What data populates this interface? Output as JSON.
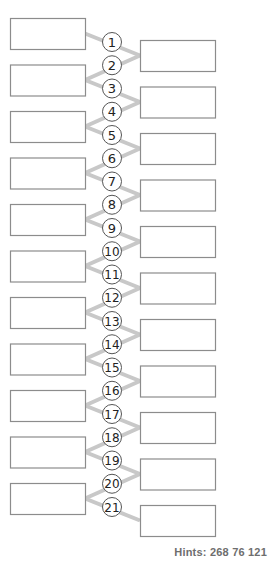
{
  "diagram": {
    "left_boxes": [
      {
        "id": 1,
        "text": ""
      },
      {
        "id": 2,
        "text": ""
      },
      {
        "id": 3,
        "text": ""
      },
      {
        "id": 4,
        "text": ""
      },
      {
        "id": 5,
        "text": ""
      },
      {
        "id": 6,
        "text": ""
      },
      {
        "id": 7,
        "text": ""
      },
      {
        "id": 8,
        "text": ""
      },
      {
        "id": 9,
        "text": ""
      },
      {
        "id": 10,
        "text": ""
      },
      {
        "id": 11,
        "text": ""
      }
    ],
    "right_boxes": [
      {
        "id": 1,
        "text": ""
      },
      {
        "id": 2,
        "text": ""
      },
      {
        "id": 3,
        "text": ""
      },
      {
        "id": 4,
        "text": ""
      },
      {
        "id": 5,
        "text": ""
      },
      {
        "id": 6,
        "text": ""
      },
      {
        "id": 7,
        "text": ""
      },
      {
        "id": 8,
        "text": ""
      },
      {
        "id": 9,
        "text": ""
      },
      {
        "id": 10,
        "text": ""
      },
      {
        "id": 11,
        "text": ""
      }
    ],
    "connectors": [
      "1",
      "2",
      "3",
      "4",
      "5",
      "6",
      "7",
      "8",
      "9",
      "10",
      "11",
      "12",
      "13",
      "14",
      "15",
      "16",
      "17",
      "18",
      "19",
      "20",
      "21"
    ],
    "colors": {
      "box_border": "#8c8c8c",
      "line": "#c8c8c8",
      "circle_border": "#555555",
      "circle_text": "#222222"
    }
  },
  "hints": {
    "label": "Hints:",
    "values": "268 76 121"
  }
}
